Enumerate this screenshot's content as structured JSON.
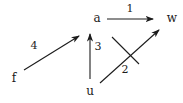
{
  "diagram": {
    "colors": {
      "background": "#ffffff",
      "stroke": "#1c1c1c"
    },
    "nodes": {
      "f": {
        "label": "f"
      },
      "a": {
        "label": "a"
      },
      "u": {
        "label": "u"
      },
      "w": {
        "label": "w"
      }
    },
    "edges": [
      {
        "label": "1",
        "from": "a",
        "to": "w",
        "style": "solid-arrow"
      },
      {
        "label": "2",
        "from": "u",
        "to": "w",
        "style": "solid-arrow-crossed-out"
      },
      {
        "label": "3",
        "from": "u",
        "to": "a",
        "style": "solid-arrow"
      },
      {
        "label": "4",
        "from": "f",
        "to": "a",
        "style": "solid-arrow"
      }
    ]
  }
}
